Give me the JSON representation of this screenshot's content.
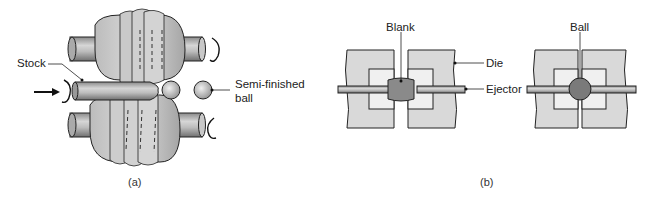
{
  "figure": {
    "panel_a": {
      "caption": "(a)",
      "labels": {
        "stock": "Stock",
        "semi_finished_line1": "Semi-finished",
        "semi_finished_line2": "ball"
      }
    },
    "panel_b": {
      "caption": "(b)",
      "labels": {
        "blank": "Blank",
        "die": "Die",
        "ejector": "Ejector",
        "ball": "Ball"
      }
    }
  },
  "colors": {
    "metal_light": "#d8d8d8",
    "metal_mid": "#a8a8a8",
    "metal_dark": "#6e6e6e",
    "die_fill": "#d9d9d9",
    "outline": "#222222"
  }
}
